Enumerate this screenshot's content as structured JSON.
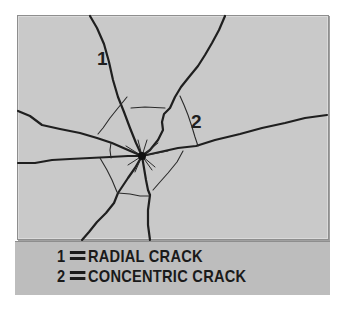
{
  "diagram": {
    "colors": {
      "panel_background": "#c9c9c9",
      "legend_background": "#bdbdbd",
      "crack_line": "#1f1f1f",
      "border": "#8e8e8e",
      "text": "#1a1a1a"
    },
    "impact_point": {
      "x": 142,
      "y": 156
    },
    "labels": [
      {
        "text": "1",
        "x": 97,
        "y": 65,
        "refers_to": "radial"
      },
      {
        "text": "2",
        "x": 191,
        "y": 128,
        "refers_to": "concentric"
      }
    ],
    "radial_cracks": [
      {
        "name": "upper-left-radial",
        "points": "90,16 97,28 104,44 109,62 113,80 118,97 124,112 130,128 136,143 142,156"
      },
      {
        "name": "upper-right-radial",
        "points": "225,16 219,30 212,43 205,55 198,66 189,77 181,87 175,97 170,108 164,114 162,122 163,130 158,140 150,150 142,156"
      },
      {
        "name": "left-radial",
        "points": "18,111 30,116 42,125 60,129 80,133 97,138 112,143 128,150 142,156"
      },
      {
        "name": "right-radial",
        "points": "142,156 160,152 178,148 196,146 215,140 240,134 262,128 285,123 305,118 327,115"
      },
      {
        "name": "left-horizontal-radial",
        "points": "18,163 35,163 52,160 70,159 90,158 110,157 128,156 142,156"
      },
      {
        "name": "lower-left-radial",
        "points": "142,156 135,168 128,178 122,187 118,193 114,203 106,213 97,222 89,232 82,240"
      },
      {
        "name": "lower-center-radial",
        "points": "142,156 144,168 146,180 148,190 150,195 148,210 148,225 150,240"
      }
    ],
    "concentric_cracks": [
      {
        "name": "concentric-top",
        "points": "131,108 145,107 165,108"
      },
      {
        "name": "concentric-upper-left",
        "points": "127,97 118,108 110,118 103,128 98,134"
      },
      {
        "name": "concentric-left",
        "points": "111,143 110,150 111,158"
      },
      {
        "name": "concentric-upper-right",
        "points": "180,96 184,105 188,115 192,127 195,137 198,146"
      },
      {
        "name": "concentric-lower-left",
        "points": "100,158 107,170 112,180 117,192"
      },
      {
        "name": "concentric-bottom",
        "points": "118,193 130,194 140,196 150,196"
      },
      {
        "name": "concentric-lower-right",
        "points": "183,151 177,162 168,173 160,182 153,190"
      }
    ],
    "spikes": [
      "142,156 138,140",
      "142,156 147,140",
      "142,156 158,143",
      "142,156 168,151",
      "142,156 155,167",
      "142,156 152,170",
      "142,156 135,172",
      "142,156 128,165",
      "142,156 126,146"
    ],
    "legend": {
      "items": [
        {
          "number": "1",
          "label": "RADIAL CRACK"
        },
        {
          "number": "2",
          "label": "CONCENTRIC CRACK"
        }
      ]
    }
  }
}
